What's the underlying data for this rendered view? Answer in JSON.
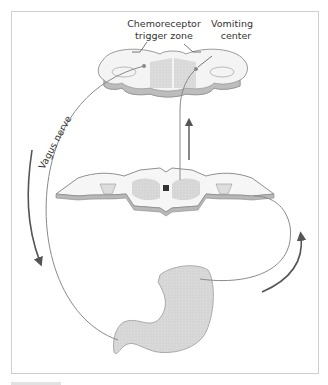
{
  "figure": {
    "labels": {
      "ctz_line1": "Chemoreceptor",
      "ctz_line2": "trigger zone",
      "vc_line1": "Vomiting",
      "vc_line2": "center",
      "vagus": "Vagus nerve"
    },
    "structures": [
      "medulla",
      "spinal-cord",
      "stomach"
    ],
    "colors": {
      "nerve": "#8a8a8a",
      "arrow": "#555555",
      "tissue_fill": "#d6d6d6",
      "outline": "#9a9a9a"
    }
  }
}
